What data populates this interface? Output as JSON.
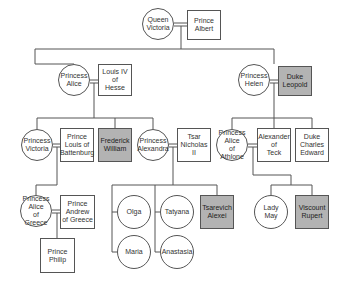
{
  "diagram": {
    "type": "family-tree",
    "colors": {
      "line": "#555555",
      "node_fill": "#ffffff",
      "highlight_fill": "#b3b3b3"
    },
    "nodes": [
      {
        "id": "queen-victoria",
        "label": "Queen\nVictoria",
        "shape": "circle",
        "highlight": false,
        "x": 142,
        "y": 8,
        "w": 32,
        "h": 32
      },
      {
        "id": "prince-albert",
        "label": "Prince\nAlbert",
        "shape": "box",
        "highlight": false,
        "x": 187,
        "y": 10,
        "w": 34,
        "h": 30
      },
      {
        "id": "princess-alice",
        "label": "Princess\nAlice",
        "shape": "circle",
        "highlight": false,
        "x": 58,
        "y": 64,
        "w": 32,
        "h": 32
      },
      {
        "id": "louis-iv-of-hesse",
        "label": "Louis IV\nof\nHesse",
        "shape": "box",
        "highlight": false,
        "x": 98,
        "y": 64,
        "w": 34,
        "h": 32
      },
      {
        "id": "princess-helen",
        "label": "Princess\nHelen",
        "shape": "circle",
        "highlight": false,
        "x": 238,
        "y": 64,
        "w": 32,
        "h": 32
      },
      {
        "id": "duke-leopold",
        "label": "Duke\nLeopold",
        "shape": "box",
        "highlight": true,
        "x": 278,
        "y": 66,
        "w": 34,
        "h": 30
      },
      {
        "id": "princess-victoria",
        "label": "Princess\nVictoria",
        "shape": "circle",
        "highlight": false,
        "x": 21,
        "y": 129,
        "w": 32,
        "h": 32
      },
      {
        "id": "prince-louis-of-battenburg",
        "label": "Prince\nLouis of\nBattenburg",
        "shape": "box",
        "highlight": false,
        "x": 60,
        "y": 128,
        "w": 34,
        "h": 34
      },
      {
        "id": "frederick-william",
        "label": "Frederick\nWilliam",
        "shape": "box",
        "highlight": true,
        "x": 98,
        "y": 128,
        "w": 34,
        "h": 34
      },
      {
        "id": "princess-alexandra",
        "label": "Princess\nAlexandra",
        "shape": "circle",
        "highlight": false,
        "x": 137,
        "y": 129,
        "w": 32,
        "h": 32
      },
      {
        "id": "tsar-nicholas-ii",
        "label": "Tsar\nNicholas\nII",
        "shape": "box",
        "highlight": false,
        "x": 177,
        "y": 128,
        "w": 34,
        "h": 34
      },
      {
        "id": "princess-alice-of-athlone",
        "label": "Princess\nAlice\nof Athlone",
        "shape": "circle",
        "highlight": false,
        "x": 216,
        "y": 129,
        "w": 32,
        "h": 32
      },
      {
        "id": "alexander-of-teck",
        "label": "Alexander\nof\nTeck",
        "shape": "box",
        "highlight": false,
        "x": 257,
        "y": 128,
        "w": 34,
        "h": 34
      },
      {
        "id": "duke-charles-edward",
        "label": "Duke\nCharles\nEdward",
        "shape": "box",
        "highlight": false,
        "x": 295,
        "y": 128,
        "w": 34,
        "h": 34
      },
      {
        "id": "princess-alice-of-greece",
        "label": "Princess\nAlice\nof Greece",
        "shape": "circle",
        "highlight": false,
        "x": 20,
        "y": 195,
        "w": 32,
        "h": 32
      },
      {
        "id": "prince-andrew-of-greece",
        "label": "Prince\nAndrew\nof Greece",
        "shape": "box",
        "highlight": false,
        "x": 60,
        "y": 195,
        "w": 35,
        "h": 34
      },
      {
        "id": "prince-philip",
        "label": "Prince\nPhilip",
        "shape": "box",
        "highlight": false,
        "x": 40,
        "y": 238,
        "w": 35,
        "h": 35
      },
      {
        "id": "olga",
        "label": "Olga",
        "shape": "circle",
        "highlight": false,
        "x": 117,
        "y": 195,
        "w": 34,
        "h": 34
      },
      {
        "id": "tatyana",
        "label": "Tatyana",
        "shape": "circle",
        "highlight": false,
        "x": 160,
        "y": 195,
        "w": 34,
        "h": 34
      },
      {
        "id": "tsarevich-alexei",
        "label": "Tsarevich\nAlexei",
        "shape": "box",
        "highlight": true,
        "x": 200,
        "y": 195,
        "w": 34,
        "h": 34
      },
      {
        "id": "maria",
        "label": "Maria",
        "shape": "circle",
        "highlight": false,
        "x": 117,
        "y": 235,
        "w": 34,
        "h": 34
      },
      {
        "id": "anastasia",
        "label": "Anastasia",
        "shape": "circle",
        "highlight": false,
        "x": 160,
        "y": 235,
        "w": 34,
        "h": 34
      },
      {
        "id": "lady-may",
        "label": "Lady\nMay",
        "shape": "circle",
        "highlight": false,
        "x": 254,
        "y": 195,
        "w": 34,
        "h": 34
      },
      {
        "id": "viscount-rupert",
        "label": "Viscount\nRupert",
        "shape": "box",
        "highlight": true,
        "x": 295,
        "y": 195,
        "w": 34,
        "h": 34
      }
    ],
    "marriages": [
      [
        "queen-victoria",
        "prince-albert"
      ],
      [
        "princess-alice",
        "louis-iv-of-hesse"
      ],
      [
        "princess-helen",
        "duke-leopold"
      ],
      [
        "princess-victoria",
        "prince-louis-of-battenburg"
      ],
      [
        "princess-alexandra",
        "tsar-nicholas-ii"
      ],
      [
        "princess-alice-of-athlone",
        "alexander-of-teck"
      ],
      [
        "princess-alice-of-greece",
        "prince-andrew-of-greece"
      ]
    ]
  }
}
